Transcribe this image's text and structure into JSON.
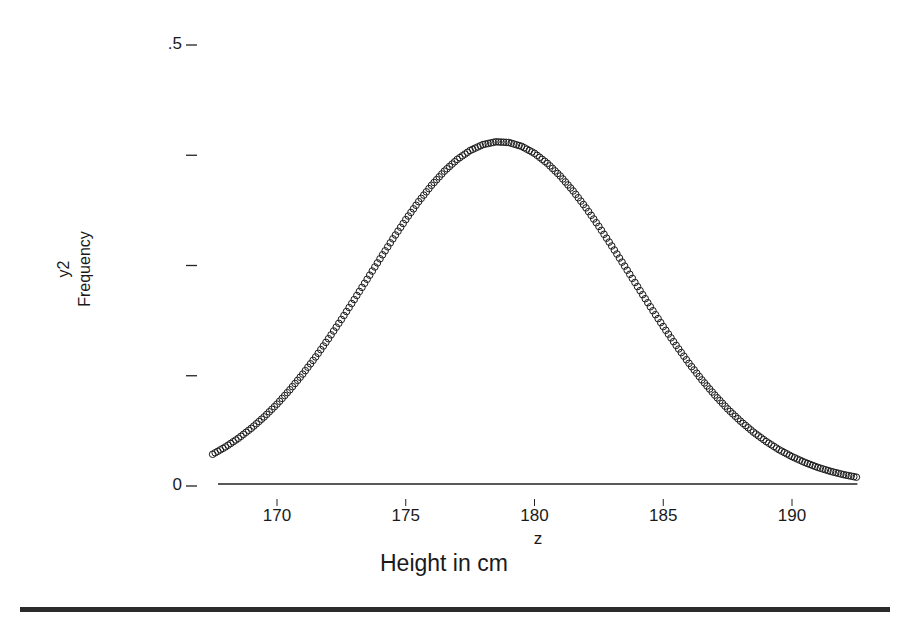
{
  "chart_data": {
    "type": "scatter",
    "title": "",
    "xlabel": "Height in cm",
    "xvar": "z",
    "ylabel": "Frequency",
    "yvar": "y2",
    "xlim": [
      167.5,
      192.5
    ],
    "ylim": [
      0,
      0.5
    ],
    "xticks": [
      170,
      175,
      180,
      185,
      190
    ],
    "xtick_labels": [
      "170",
      "175",
      "180",
      "185",
      "190"
    ],
    "yticks": [
      0,
      0.125,
      0.25,
      0.375,
      0.5
    ],
    "ytick_labels": [
      "0",
      "",
      "",
      "",
      ".5"
    ],
    "grid": false,
    "legend": null,
    "marker": "open-circle",
    "series": [
      {
        "name": "y2",
        "x": [
          167.5,
          168.0,
          168.5,
          169.0,
          169.5,
          170.0,
          170.5,
          171.0,
          171.5,
          172.0,
          172.5,
          173.0,
          173.5,
          174.0,
          174.5,
          175.0,
          175.5,
          176.0,
          176.5,
          177.0,
          177.5,
          178.0,
          178.5,
          179.0,
          179.5,
          180.0,
          180.5,
          181.0,
          181.5,
          182.0,
          182.5,
          183.0,
          183.5,
          184.0,
          184.5,
          185.0,
          185.5,
          186.0,
          186.5,
          187.0,
          187.5,
          188.0,
          188.5,
          189.0,
          189.5,
          190.0,
          190.5,
          191.0,
          191.5,
          192.0,
          192.5
        ],
        "y": [
          0.036,
          0.0443,
          0.0541,
          0.0654,
          0.0783,
          0.0928,
          0.1091,
          0.1269,
          0.1463,
          0.167,
          0.1888,
          0.2114,
          0.2344,
          0.2576,
          0.2802,
          0.302,
          0.3224,
          0.3409,
          0.357,
          0.3703,
          0.3804,
          0.3871,
          0.3902,
          0.3895,
          0.3851,
          0.3772,
          0.3658,
          0.3515,
          0.3345,
          0.3153,
          0.2943,
          0.2721,
          0.2493,
          0.2261,
          0.2032,
          0.1808,
          0.1594,
          0.1391,
          0.1203,
          0.1031,
          0.0874,
          0.0735,
          0.0611,
          0.0504,
          0.0411,
          0.0333,
          0.0267,
          0.0211,
          0.0166,
          0.0129,
          0.01
        ]
      }
    ]
  },
  "style": {
    "ink": "#1a1a1a",
    "axis": "#222222",
    "background": "#ffffff"
  }
}
